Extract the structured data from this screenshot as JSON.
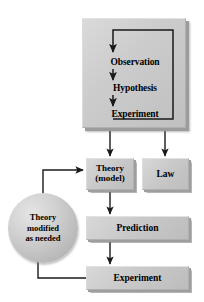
{
  "diagram": {
    "type": "flowchart",
    "background_color": "#ffffff",
    "node_fill_color": "#cccccc",
    "line_color": "#1a1a1a"
  },
  "cycle_panel": {
    "name": "observation-hypothesis-experiment-cycle",
    "steps": [
      {
        "label": "Observation"
      },
      {
        "label": "Hypothesis"
      },
      {
        "label": "Experiment"
      }
    ],
    "loop_note": "Experiment feeds back up to Observation"
  },
  "nodes": {
    "theory": {
      "line1": "Theory",
      "line2": "(model)"
    },
    "law": {
      "label": "Law"
    },
    "prediction": {
      "label": "Prediction"
    },
    "experiment": {
      "label": "Experiment"
    },
    "modified": {
      "line1": "Theory",
      "line2": "modified",
      "line3": "as needed"
    }
  },
  "edges": [
    {
      "from": "cycle_panel",
      "to": "theory",
      "style": "arrow"
    },
    {
      "from": "cycle_panel",
      "to": "law",
      "style": "arrow"
    },
    {
      "from": "theory",
      "to": "prediction",
      "style": "arrow"
    },
    {
      "from": "prediction",
      "to": "experiment",
      "style": "arrow"
    },
    {
      "from": "experiment",
      "to": "modified",
      "style": "line"
    },
    {
      "from": "modified",
      "to": "theory",
      "style": "arrow"
    },
    {
      "from": "experiment_step",
      "to": "observation_step",
      "style": "arrow"
    }
  ]
}
